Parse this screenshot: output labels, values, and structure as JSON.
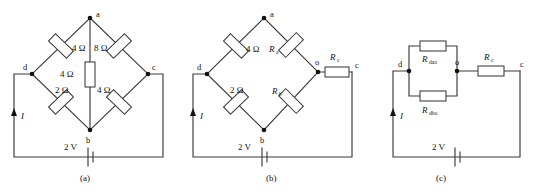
{
  "figure": {
    "type": "circuit-diagram",
    "panels": [
      {
        "caption": "(a)",
        "nodes": [
          "a",
          "b",
          "c",
          "d"
        ],
        "current_label": "I",
        "source_label": "2 V",
        "resistors": [
          {
            "name": "R-da",
            "label": "4 Ω",
            "between": [
              "d",
              "a"
            ]
          },
          {
            "name": "R-ac",
            "label": "8 Ω",
            "between": [
              "a",
              "c"
            ]
          },
          {
            "name": "R-ab",
            "label": "4 Ω",
            "between": [
              "a",
              "b"
            ]
          },
          {
            "name": "R-db",
            "label": "2 Ω",
            "between": [
              "d",
              "b"
            ]
          },
          {
            "name": "R-bc",
            "label": "4 Ω",
            "between": [
              "b",
              "c"
            ]
          }
        ]
      },
      {
        "caption": "(b)",
        "nodes": [
          "a",
          "b",
          "c",
          "d",
          "o"
        ],
        "current_label": "I",
        "source_label": "2 V",
        "resistors": [
          {
            "name": "R-da",
            "label": "4 Ω",
            "sub": "",
            "between": [
              "d",
              "a"
            ]
          },
          {
            "name": "R-a",
            "label": "R",
            "sub": "a",
            "between": [
              "a",
              "o"
            ]
          },
          {
            "name": "R-db",
            "label": "2 Ω",
            "sub": "",
            "between": [
              "d",
              "b"
            ]
          },
          {
            "name": "R-b",
            "label": "R",
            "sub": "b",
            "between": [
              "b",
              "o"
            ]
          },
          {
            "name": "R-c",
            "label": "R",
            "sub": "c",
            "between": [
              "o",
              "c"
            ]
          }
        ]
      },
      {
        "caption": "(c)",
        "nodes": [
          "c",
          "d",
          "o"
        ],
        "current_label": "I",
        "source_label": "2 V",
        "resistors": [
          {
            "name": "R-dao",
            "label": "R",
            "sub": "dao",
            "between": [
              "d",
              "o"
            ]
          },
          {
            "name": "R-dbo",
            "label": "R",
            "sub": "dbo",
            "between": [
              "d",
              "o"
            ]
          },
          {
            "name": "R-c",
            "label": "R",
            "sub": "c",
            "between": [
              "o",
              "c"
            ]
          }
        ]
      }
    ],
    "colors": {
      "wire": "#3a3a3a",
      "text": "#111111",
      "background": "#ffffff"
    }
  }
}
